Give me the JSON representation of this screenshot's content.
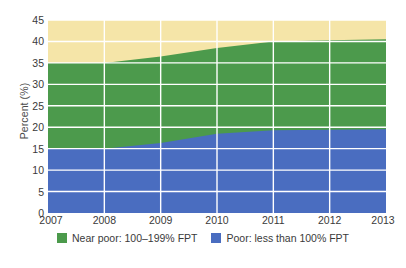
{
  "chart_data": {
    "type": "area",
    "title": "",
    "subtitle": "",
    "xlabel": "",
    "ylabel": "Percent (%)",
    "x": [
      2007,
      2008,
      2009,
      2010,
      2011,
      2012,
      2013
    ],
    "xticklabels": [
      "2007",
      "2008",
      "2009",
      "2010",
      "2011",
      "2012",
      "2013"
    ],
    "xlim": [
      2007,
      2013
    ],
    "ylim": [
      0,
      45
    ],
    "yticks": [
      0,
      5,
      10,
      15,
      20,
      25,
      30,
      35,
      40,
      45
    ],
    "yticklabels": [
      "0",
      "5",
      "10",
      "15",
      "20",
      "25",
      "30",
      "35",
      "40",
      "45"
    ],
    "grid": true,
    "grid_color": "#FFFFFF",
    "stacked": true,
    "legend_position": "bottom",
    "plot_background": "#F5E5A8",
    "series": [
      {
        "name": "Poor: less than 100% FPT",
        "color": "#4A6DC0",
        "values": [
          15.0,
          15.0,
          16.3,
          18.5,
          19.3,
          19.4,
          19.5
        ]
      },
      {
        "name": "Near poor: 100–199% FPT",
        "color": "#4C9A4C",
        "values": [
          20.0,
          20.0,
          20.2,
          20.0,
          20.7,
          20.9,
          21.0
        ],
        "cumulative_top": [
          35.0,
          35.0,
          36.5,
          38.5,
          40.0,
          40.3,
          40.5
        ]
      }
    ]
  },
  "legend": {
    "items": [
      {
        "label": "Near poor: 100–199% FPT",
        "color": "#4C9A4C",
        "swatch_name": "legend-swatch-near-poor"
      },
      {
        "label": "Poor: less than 100% FPT",
        "color": "#4A6DC0",
        "swatch_name": "legend-swatch-poor"
      }
    ]
  },
  "colors": {
    "green": "#4C9A4C",
    "blue": "#4A6DC0",
    "yellow": "#F5E5A8",
    "gridline": "#FFFFFF",
    "text": "#3A3A3A"
  }
}
